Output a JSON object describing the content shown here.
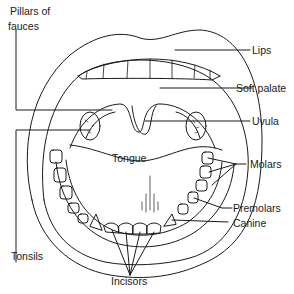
{
  "diagram": {
    "labels": {
      "pillars_of_fauces_line1": "Pillars of",
      "pillars_of_fauces_line2": "fauces",
      "lips": "Lips",
      "soft_palate": "Soft palate",
      "uvula": "Uvula",
      "tongue": "Tongue",
      "molars": "Molars",
      "premolars": "Premolars",
      "canine": "Canine",
      "tonsils": "Tonsils",
      "incisors": "Incisors"
    },
    "colors": {
      "stroke": "#1a1a1a",
      "background": "#ffffff"
    }
  }
}
